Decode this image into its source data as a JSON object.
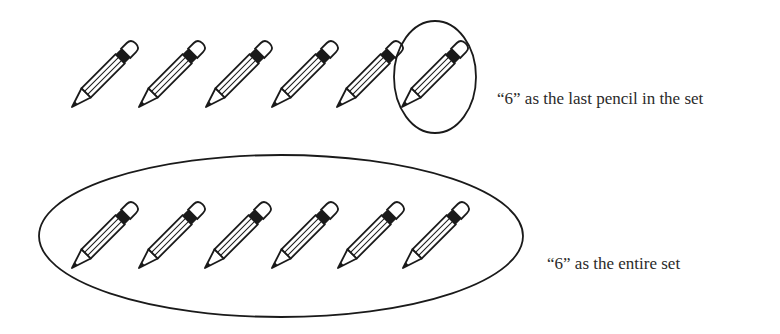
{
  "diagram": {
    "rows": [
      {
        "id": "last-pencil",
        "pencil_count": 6,
        "circled": "last pencil only",
        "label": "“6” as the last pencil in the set"
      },
      {
        "id": "entire-set",
        "pencil_count": 6,
        "circled": "entire set",
        "label": "“6” as the entire set"
      }
    ],
    "icons": {
      "pencil": "pencil-icon",
      "enclosure": "ellipse-outline"
    },
    "colors": {
      "stroke": "#1a1a1a",
      "background": "#ffffff",
      "text": "#2a2a2a"
    }
  }
}
